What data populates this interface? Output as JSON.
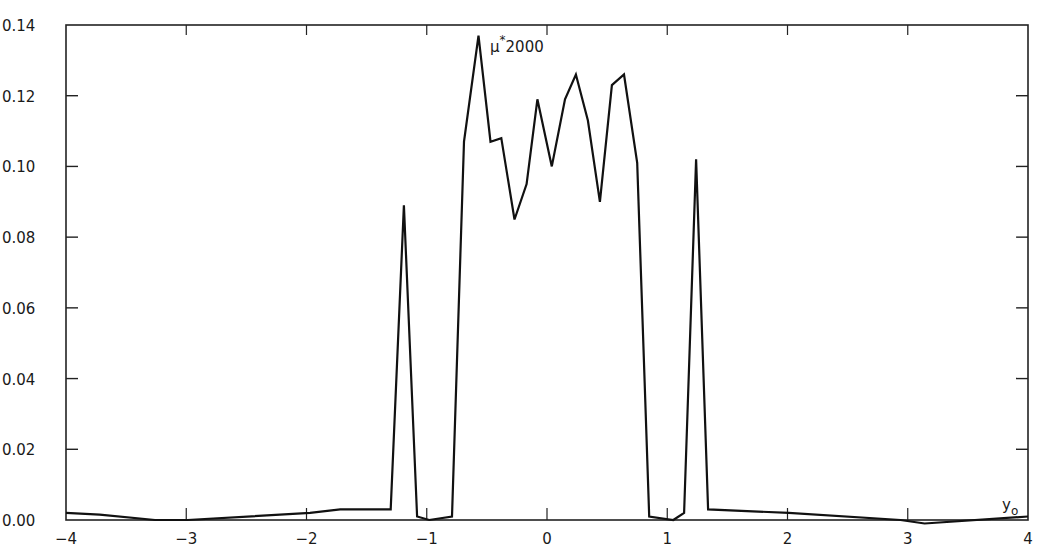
{
  "chart_data": {
    "type": "line",
    "title": "",
    "xlabel": "y_o",
    "ylabel": "",
    "annotation": "μ* 2000",
    "xlim": [
      -4,
      4
    ],
    "ylim": [
      0.0,
      0.14
    ],
    "grid": false,
    "legend": null,
    "x_ticks": [
      -4,
      -3,
      -2,
      -1,
      0,
      1,
      2,
      3,
      4
    ],
    "x_tick_labels": [
      "-4",
      "-3",
      "-2",
      "-1",
      "0",
      "1",
      "2",
      "3",
      "4"
    ],
    "y_ticks": [
      0.0,
      0.02,
      0.04,
      0.06,
      0.08,
      0.1,
      0.12,
      0.14
    ],
    "y_tick_labels": [
      "0.00",
      "0.02",
      "0.04",
      "0.06",
      "0.08",
      "0.10",
      "0.12",
      "0.14"
    ],
    "series": [
      {
        "name": "μ* 2000",
        "color": "#111111",
        "x": [
          -4.0,
          -3.72,
          -3.26,
          -2.99,
          -1.97,
          -1.72,
          -1.3,
          -1.19,
          -1.08,
          -0.98,
          -0.79,
          -0.69,
          -0.57,
          -0.47,
          -0.38,
          -0.27,
          -0.17,
          -0.08,
          0.04,
          0.15,
          0.24,
          0.34,
          0.44,
          0.54,
          0.64,
          0.75,
          0.85,
          1.05,
          1.14,
          1.24,
          1.34,
          2.01,
          2.94,
          3.14,
          4.0
        ],
        "y": [
          0.002,
          0.0015,
          0.0,
          0.0,
          0.002,
          0.003,
          0.003,
          0.089,
          0.001,
          0.0,
          0.001,
          0.107,
          0.137,
          0.107,
          0.108,
          0.085,
          0.095,
          0.119,
          0.1,
          0.119,
          0.126,
          0.113,
          0.09,
          0.123,
          0.126,
          0.101,
          0.001,
          0.0,
          0.002,
          0.102,
          0.003,
          0.002,
          0.0,
          -0.001,
          0.001
        ]
      }
    ]
  }
}
